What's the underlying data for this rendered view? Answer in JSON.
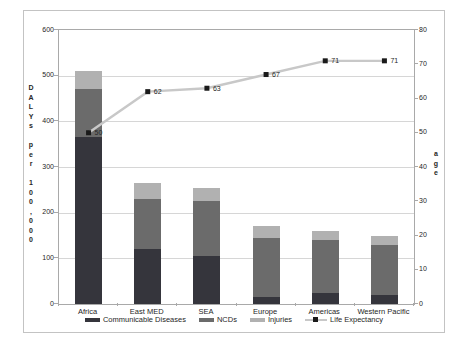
{
  "colors": {
    "communicable": "#35353c",
    "ncds": "#6b6b6b",
    "injuries": "#b1b1b1",
    "line": "#c8c8c8",
    "marker": "#1a1a1a",
    "gridline": "#d6d6d6",
    "axis": "#a9a9a9",
    "text": "#262626"
  },
  "chart_data": {
    "type": "bar",
    "subtype": "stacked-column-with-line",
    "title": "",
    "categories": [
      "Africa",
      "East MED",
      "SEA",
      "Europe",
      "Americas",
      "Western Pacific"
    ],
    "series": [
      {
        "name": "Communicable Diseases",
        "color": "#35353c",
        "values": [
          365,
          120,
          105,
          15,
          25,
          20
        ]
      },
      {
        "name": "NCDs",
        "color": "#6b6b6b",
        "values": [
          105,
          110,
          120,
          130,
          115,
          110
        ]
      },
      {
        "name": "Injuries",
        "color": "#b1b1b1",
        "values": [
          40,
          35,
          30,
          25,
          20,
          20
        ]
      }
    ],
    "line_series": {
      "name": "Life Expectancy",
      "axis": "right",
      "color": "#c8c8c8",
      "marker_color": "#1a1a1a",
      "values": [
        50,
        62,
        63,
        67,
        71,
        71
      ],
      "labels": [
        "50",
        "62",
        "63",
        "67",
        "71",
        "71"
      ]
    },
    "legend": [
      "Communicable Diseases",
      "NCDs",
      "Injuries",
      "Life Expectancy"
    ],
    "legend_position": "bottom",
    "grid": true,
    "left_axis": {
      "label": "DALYs per 100,000",
      "min": 0,
      "max": 600,
      "step": 100,
      "ticks": [
        "0",
        "100",
        "200",
        "300",
        "400",
        "500",
        "600"
      ]
    },
    "right_axis": {
      "label": "age",
      "min": 0,
      "max": 80,
      "step": 10,
      "ticks": [
        "0",
        "10",
        "20",
        "30",
        "40",
        "50",
        "60",
        "70",
        "80"
      ]
    }
  }
}
